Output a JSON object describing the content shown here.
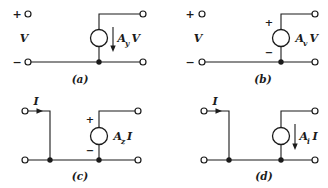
{
  "colors": {
    "line": "#1b1b1b",
    "background": "#ffffff"
  },
  "panels": {
    "a": {
      "caption": "(a)",
      "input_plus": "+",
      "input_minus": "−",
      "input_var": "V",
      "gain_base": "A",
      "gain_sub": "y",
      "gain_var": "V"
    },
    "b": {
      "caption": "(b)",
      "input_plus": "+",
      "input_minus": "−",
      "input_var": "V",
      "source_plus": "+",
      "source_minus": "−",
      "gain_base": "A",
      "gain_sub": "v",
      "gain_var": "V"
    },
    "c": {
      "caption": "(c)",
      "input_var": "I",
      "source_plus": "+",
      "source_minus": "−",
      "gain_base": "A",
      "gain_sub": "z",
      "gain_var": "I"
    },
    "d": {
      "caption": "(d)",
      "input_var": "I",
      "gain_base": "A",
      "gain_sub": "i",
      "gain_var": "I"
    }
  }
}
